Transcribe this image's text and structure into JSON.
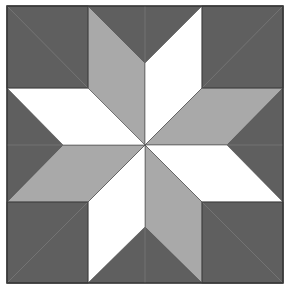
{
  "figure": {
    "colors": {
      "dark": "#5f5f5f",
      "medium": "#a9a9a9",
      "light": "#ffffff",
      "border": "#3a3a3a",
      "seam": "#7d7d7d"
    }
  }
}
